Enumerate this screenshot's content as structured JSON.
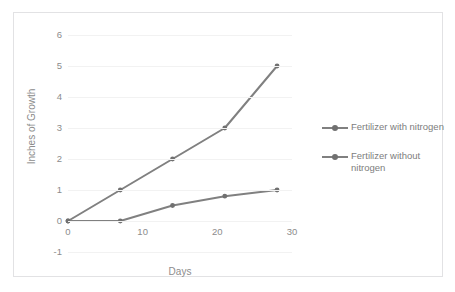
{
  "chart_data": {
    "type": "line",
    "title": "",
    "xlabel": "Days",
    "ylabel": "Inches of Growth",
    "x": [
      0,
      7,
      14,
      21,
      28
    ],
    "xlim": [
      0,
      30
    ],
    "ylim": [
      -1,
      6
    ],
    "xticks": [
      "0",
      "10",
      "20",
      "30"
    ],
    "xtick_values": [
      0,
      10,
      20,
      30
    ],
    "yticks": [
      "-1",
      "0",
      "1",
      "2",
      "3",
      "4",
      "5",
      "6"
    ],
    "ytick_values": [
      -1,
      0,
      1,
      2,
      3,
      4,
      5,
      6
    ],
    "grid": true,
    "legend_position": "right",
    "series": [
      {
        "name": "Fertilizer with nitrogen",
        "color": "#808080",
        "values": [
          0,
          1,
          2,
          3,
          5
        ]
      },
      {
        "name": "Fertilizer without nitrogen",
        "color": "#808080",
        "values": [
          0,
          0,
          0.5,
          0.8,
          1
        ]
      }
    ]
  },
  "legend": {
    "entries": [
      {
        "label": "Fertilizer with nitrogen"
      },
      {
        "label": "Fertilizer without nitrogen"
      }
    ]
  },
  "colors": {
    "series_line": "#808080",
    "marker": "#707070",
    "gridline": "#f2f2f2",
    "tick_text": "#8c8c8c",
    "frame_border": "#e2e2e4",
    "background": "#ffffff"
  }
}
